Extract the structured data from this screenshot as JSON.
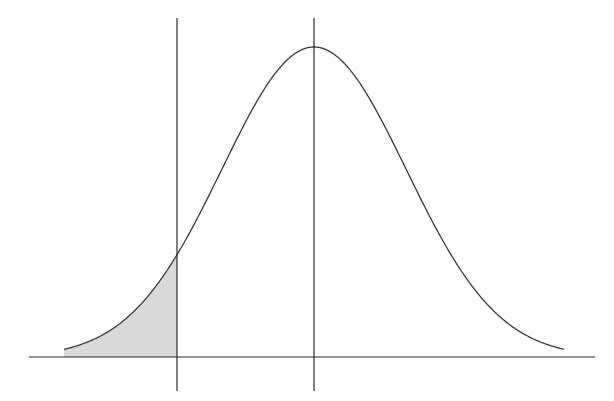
{
  "chart_data": {
    "type": "area",
    "title": "",
    "subtitle": "",
    "xlabel": "",
    "ylabel": "",
    "distribution": {
      "mean_z": 0,
      "sd_z": 1
    },
    "x_range_z": [
      -2.72,
      2.72
    ],
    "cutoff_z": -1.49,
    "shaded_region": "left tail (x < cutoff)",
    "vertical_lines": [
      {
        "name": "cutoff",
        "z": -1.49
      },
      {
        "name": "mean",
        "z": 0
      }
    ],
    "tick_labels": [],
    "legend": [],
    "grid": false,
    "colors": {
      "curve": "#3a3a3a",
      "axis": "#2a2a2a",
      "shade": "#d9d9d9",
      "background": "#ffffff"
    }
  },
  "layout": {
    "width": 614,
    "height": 401,
    "baseline_y": 357,
    "axis_x0": 29,
    "axis_x1": 595,
    "mean_x": 314,
    "sigma_px": 92,
    "peak_height_px": 310,
    "curve_x0": 64,
    "curve_x1": 564,
    "cutoff_x": 177,
    "vline_top": 18,
    "vline_bottom": 391
  }
}
